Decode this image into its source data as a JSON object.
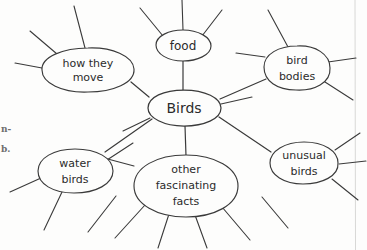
{
  "diagram": {
    "type": "mind-map",
    "title_node": "Birds",
    "medium": "hand-drawn pencil on paper",
    "ink_color": "#3a3a3a",
    "paper_color": "#fdfdfc",
    "nodes": [
      {
        "id": "center",
        "label": "Birds",
        "lines": [
          "Birds"
        ],
        "cx": 184,
        "cy": 108,
        "rx": 37,
        "ry": 18,
        "font_size": 14,
        "is_center": true,
        "spoke_count": 6
      },
      {
        "id": "how-they-move",
        "label": "how they move",
        "lines": [
          "how  they",
          "move"
        ],
        "cx": 88,
        "cy": 70,
        "rx": 46,
        "ry": 22,
        "font_size": 11,
        "is_center": false,
        "spoke_count": 3
      },
      {
        "id": "food",
        "label": "food",
        "lines": [
          "food"
        ],
        "cx": 183,
        "cy": 45,
        "rx": 27,
        "ry": 15,
        "font_size": 12,
        "is_center": false,
        "spoke_count": 3
      },
      {
        "id": "bird-bodies",
        "label": "bird bodies",
        "lines": [
          "bird",
          "bodies"
        ],
        "cx": 297,
        "cy": 68,
        "rx": 33,
        "ry": 22,
        "font_size": 11,
        "is_center": false,
        "spoke_count": 4
      },
      {
        "id": "unusual-birds",
        "label": "unusual birds",
        "lines": [
          "unusual",
          "birds"
        ],
        "cx": 304,
        "cy": 163,
        "rx": 35,
        "ry": 21,
        "font_size": 11,
        "is_center": false,
        "spoke_count": 3
      },
      {
        "id": "other-fascinating-facts",
        "label": "other fascinating facts",
        "lines": [
          "other",
          "fascinating",
          "facts"
        ],
        "cx": 186,
        "cy": 186,
        "rx": 52,
        "ry": 31,
        "font_size": 11,
        "is_center": false,
        "spoke_count": 5
      },
      {
        "id": "water-birds",
        "label": "water birds",
        "lines": [
          "water",
          "birds"
        ],
        "cx": 75,
        "cy": 171,
        "rx": 38,
        "ry": 22,
        "font_size": 11,
        "is_center": false,
        "spoke_count": 3
      }
    ],
    "connectors": [
      {
        "from": "center",
        "to": "how-they-move"
      },
      {
        "from": "center",
        "to": "food"
      },
      {
        "from": "center",
        "to": "bird-bodies"
      },
      {
        "from": "center",
        "to": "unusual-birds"
      },
      {
        "from": "center",
        "to": "other-fascinating-facts"
      },
      {
        "from": "center",
        "to": "water-birds"
      }
    ],
    "margin_text": {
      "line1": "n-",
      "line2": "b."
    }
  }
}
